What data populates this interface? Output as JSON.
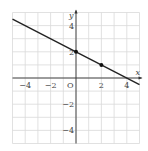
{
  "diagram": {
    "type": "coordinate-plane-line",
    "axes": {
      "x_label": "x",
      "y_label": "y",
      "origin_label": "O",
      "x_range": [
        -5,
        5
      ],
      "y_range": [
        -5,
        5
      ],
      "grid_step": 1
    },
    "x_ticks": [
      {
        "value": -4,
        "label": "−4"
      },
      {
        "value": -2,
        "label": "−2"
      },
      {
        "value": 2,
        "label": "2"
      },
      {
        "value": 4,
        "label": "4"
      }
    ],
    "y_ticks": [
      {
        "value": 4,
        "label": "4"
      },
      {
        "value": 2,
        "label": "2"
      },
      {
        "value": -2,
        "label": "−2"
      },
      {
        "value": -4,
        "label": "−4"
      }
    ],
    "line": {
      "equation": "y = -x/2 + 2",
      "slope": -0.5,
      "intercept": 2,
      "color": "#222222"
    },
    "points": [
      {
        "x": 0,
        "y": 2
      },
      {
        "x": 2,
        "y": 1
      }
    ],
    "colors": {
      "grid": "#d9d9d9",
      "axis": "#333333",
      "text": "#444444"
    }
  }
}
